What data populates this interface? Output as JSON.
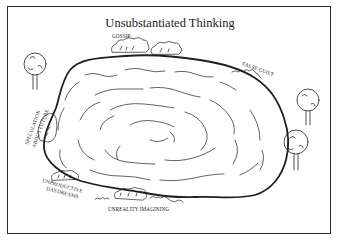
{
  "title": "Unsubstantiated Thinking",
  "labels": {
    "gossip": "GOSSIP",
    "false_guilt": "FALSE GUILT",
    "speculation_line1": "SPECULATION",
    "speculation_line2": "ABOUT FUTURE",
    "daydreams_line1": "UNPRODUCTIVE",
    "daydreams_line2": "DAYDREAMS",
    "unreality": "UNREALITY IMAGINING"
  },
  "colors": {
    "ink": "#1f1f1f",
    "background": "#ffffff"
  }
}
